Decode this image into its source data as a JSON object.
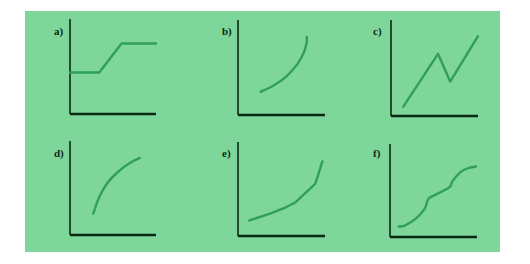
{
  "figure": {
    "background": "#7fd69a",
    "curve_color": "#2f9f5a",
    "axis_color": "#0b2a14"
  },
  "chart_data": [
    {
      "type": "line",
      "label": "a)",
      "title": "",
      "xlabel": "",
      "ylabel": "",
      "xlim": [
        0,
        10
      ],
      "ylim": [
        0,
        10
      ],
      "grid": false,
      "ticks": false,
      "series": [
        {
          "name": "a",
          "x": [
            0,
            3.4,
            6.0,
            10
          ],
          "y": [
            5.0,
            5.0,
            8.5,
            8.5
          ]
        }
      ]
    },
    {
      "type": "line",
      "label": "b)",
      "title": "",
      "xlabel": "",
      "ylabel": "",
      "xlim": [
        0,
        10
      ],
      "ylim": [
        0,
        10
      ],
      "grid": false,
      "ticks": false,
      "series": [
        {
          "name": "b",
          "x": [
            2.6,
            4.0,
            5.5,
            6.8,
            7.6,
            7.9,
            7.9
          ],
          "y": [
            2.8,
            3.5,
            4.6,
            6.1,
            7.6,
            8.8,
            9.4
          ]
        }
      ]
    },
    {
      "type": "line",
      "label": "c)",
      "title": "",
      "xlabel": "",
      "ylabel": "",
      "xlim": [
        0,
        10
      ],
      "ylim": [
        0,
        10
      ],
      "grid": false,
      "ticks": false,
      "series": [
        {
          "name": "c",
          "x": [
            1.4,
            5.4,
            6.8,
            10.0
          ],
          "y": [
            1.1,
            7.4,
            4.1,
            9.5
          ]
        }
      ]
    },
    {
      "type": "line",
      "label": "d)",
      "title": "",
      "xlabel": "",
      "ylabel": "",
      "xlim": [
        0,
        10
      ],
      "ylim": [
        0,
        10
      ],
      "grid": false,
      "ticks": false,
      "series": [
        {
          "name": "d",
          "x": [
            2.7,
            3.4,
            4.4,
            5.7,
            7.0,
            8.1
          ],
          "y": [
            2.6,
            4.6,
            6.4,
            7.8,
            8.8,
            9.4
          ]
        }
      ]
    },
    {
      "type": "line",
      "label": "e)",
      "title": "",
      "xlabel": "",
      "ylabel": "",
      "xlim": [
        0,
        10
      ],
      "ylim": [
        0,
        10
      ],
      "grid": false,
      "ticks": false,
      "series": [
        {
          "name": "e",
          "x": [
            1.3,
            3.6,
            5.5,
            6.6,
            8.1,
            8.9,
            9.7
          ],
          "y": [
            1.9,
            2.7,
            3.5,
            4.1,
            5.6,
            6.4,
            9.1
          ]
        }
      ]
    },
    {
      "type": "line",
      "label": "f)",
      "title": "",
      "xlabel": "",
      "ylabel": "",
      "xlim": [
        0,
        10
      ],
      "ylim": [
        0,
        10
      ],
      "grid": false,
      "ticks": false,
      "series": [
        {
          "name": "f",
          "x": [
            1.0,
            1.7,
            3.0,
            4.0,
            4.4,
            5.2,
            6.3,
            6.9,
            7.2,
            8.1,
            9.0,
            9.9
          ],
          "y": [
            1.3,
            1.4,
            2.3,
            3.5,
            4.7,
            5.2,
            5.8,
            6.2,
            6.9,
            8.0,
            8.5,
            8.7
          ]
        }
      ]
    }
  ]
}
